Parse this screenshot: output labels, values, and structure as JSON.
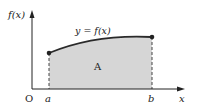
{
  "diagram": {
    "y_axis_label": "f(x)",
    "x_axis_label": "x",
    "origin_label": "O",
    "curve_label": "y = f(x)",
    "area_label": "A",
    "lower_bound_label": "a",
    "upper_bound_label": "b",
    "colors": {
      "axis": "#222222",
      "curve": "#2a2a2a",
      "shade": "#d6d6d6",
      "dashes": "#444444"
    }
  }
}
